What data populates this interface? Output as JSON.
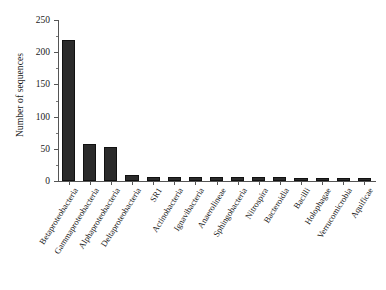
{
  "chart_data": {
    "type": "bar",
    "title": "",
    "subtitle": "",
    "xlabel": "",
    "ylabel": "Number of sequences",
    "ylim": [
      0,
      250
    ],
    "ytick_values": [
      0,
      50,
      100,
      150,
      200,
      250
    ],
    "ytick_labels": [
      "0",
      "50",
      "100",
      "150",
      "200",
      "250"
    ],
    "yminor_step": 25,
    "grid": false,
    "legend": null,
    "bar_color": "#2b2b2b",
    "axis_color": "#555555",
    "categories": [
      "Betaproteobacteria",
      "Gammaproteobacteria",
      "Alphaproteobacteria",
      "Deltaproteobacteria",
      "SR1",
      "Actinobacteria",
      "Ignavibacteria",
      "Anaerolineae",
      "Sphingobacteria",
      "Nitrospira",
      "Bacteroidia",
      "Bacilli",
      "Holophagae",
      "Verrucomicrobia",
      "Aquificae"
    ],
    "values": [
      219,
      58,
      53,
      9,
      7,
      7,
      6,
      6,
      6,
      6,
      6,
      5,
      5,
      5,
      4
    ],
    "series": [
      {
        "name": "Number of sequences",
        "values": [
          219,
          58,
          53,
          9,
          7,
          7,
          6,
          6,
          6,
          6,
          6,
          5,
          5,
          5,
          4
        ]
      }
    ]
  }
}
